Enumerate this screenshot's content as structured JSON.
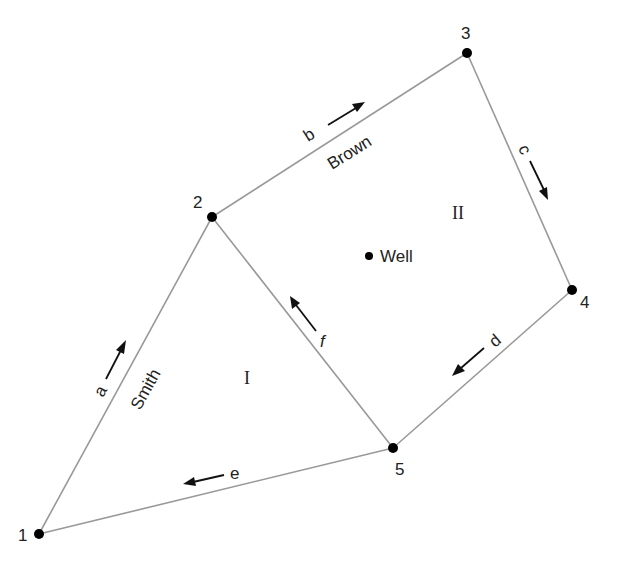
{
  "diagram": {
    "nodes": [
      {
        "id": "1",
        "label": "1",
        "x": 39,
        "y": 534
      },
      {
        "id": "2",
        "label": "2",
        "x": 212,
        "y": 217
      },
      {
        "id": "3",
        "label": "3",
        "x": 467,
        "y": 53
      },
      {
        "id": "4",
        "label": "4",
        "x": 572,
        "y": 290
      },
      {
        "id": "5",
        "label": "5",
        "x": 393,
        "y": 448
      }
    ],
    "edges": [
      {
        "id": "a",
        "label": "a",
        "from": "1",
        "to": "2",
        "name": "Smith",
        "flow_direction": "1 to 2"
      },
      {
        "id": "b",
        "label": "b",
        "from": "2",
        "to": "3",
        "name": "Brown",
        "flow_direction": "2 to 3"
      },
      {
        "id": "c",
        "label": "c",
        "from": "3",
        "to": "4",
        "name": "",
        "flow_direction": "3 to 4"
      },
      {
        "id": "d",
        "label": "d",
        "from": "4",
        "to": "5",
        "name": "",
        "flow_direction": "4 to 5"
      },
      {
        "id": "e",
        "label": "e",
        "from": "5",
        "to": "1",
        "name": "",
        "flow_direction": "5 to 1"
      },
      {
        "id": "f",
        "label": "f",
        "from": "5",
        "to": "2",
        "name": "",
        "flow_direction": "5 to 2"
      }
    ],
    "regions": [
      {
        "id": "I",
        "label": "I"
      },
      {
        "id": "II",
        "label": "II"
      }
    ],
    "well": {
      "label": "Well"
    }
  }
}
